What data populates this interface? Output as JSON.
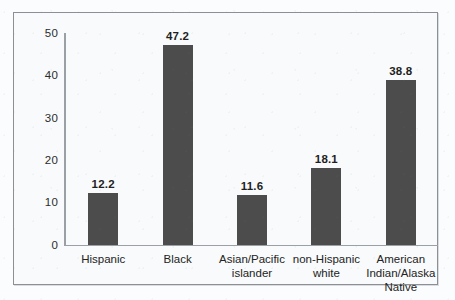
{
  "chart_data": {
    "type": "bar",
    "title": "",
    "xlabel": "",
    "ylabel": "",
    "categories": [
      "Hispanic",
      "Black",
      "Asian/Pacific\nislander",
      "non-Hispanic\nwhite",
      "American\nIndian/Alaska\nNative"
    ],
    "values": [
      12.2,
      47.2,
      11.6,
      18.1,
      38.8
    ],
    "value_labels": [
      "12.2",
      "47.2",
      "11.6",
      "18.1",
      "38.8"
    ],
    "ylim": [
      0,
      50
    ],
    "yticks": [
      0,
      10,
      20,
      30,
      40,
      50
    ],
    "ytick_labels": [
      "0",
      "10",
      "20",
      "30",
      "40",
      "50"
    ],
    "grid": false,
    "legend": false,
    "bar_color": "#4c4c4c",
    "axis_color": "#9aa0a6",
    "background_color": "#f8fafb",
    "border_color": "#8c9096"
  }
}
